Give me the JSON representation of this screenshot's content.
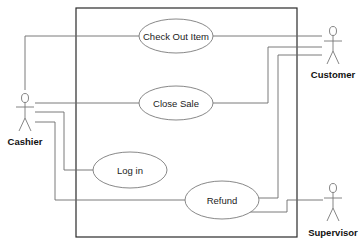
{
  "diagram": {
    "type": "uml-use-case",
    "system_boundary": {
      "x": 76,
      "y": 8,
      "width": 221,
      "height": 229
    },
    "use_cases": [
      {
        "id": "checkout",
        "label": "Check Out Item",
        "cx": 176,
        "cy": 36,
        "rx": 37,
        "ry": 17
      },
      {
        "id": "closesale",
        "label": "Close Sale",
        "cx": 176,
        "cy": 103,
        "rx": 37,
        "ry": 17
      },
      {
        "id": "login",
        "label": "Log in",
        "cx": 130,
        "cy": 170,
        "rx": 37,
        "ry": 18
      },
      {
        "id": "refund",
        "label": "Refund",
        "cx": 222,
        "cy": 200,
        "rx": 37,
        "ry": 19
      }
    ],
    "actors": [
      {
        "id": "cashier",
        "label": "Cashier",
        "x": 25,
        "y": 95
      },
      {
        "id": "customer",
        "label": "Customer",
        "x": 333,
        "y": 30
      },
      {
        "id": "supervisor",
        "label": "Supervisor",
        "x": 333,
        "y": 188
      }
    ],
    "associations": [
      {
        "from": "Cashier",
        "to": "Check Out Item"
      },
      {
        "from": "Cashier",
        "to": "Close Sale"
      },
      {
        "from": "Cashier",
        "to": "Log in"
      },
      {
        "from": "Cashier",
        "to": "Refund"
      },
      {
        "from": "Customer",
        "to": "Check Out Item"
      },
      {
        "from": "Customer",
        "to": "Close Sale"
      },
      {
        "from": "Customer",
        "to": "Refund"
      },
      {
        "from": "Supervisor",
        "to": "Refund"
      }
    ]
  }
}
